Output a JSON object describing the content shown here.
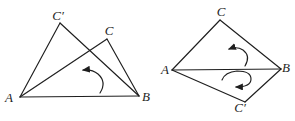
{
  "diagram": {
    "background": "#ffffff",
    "stroke": "#1e1e1e",
    "stroke_width": 1.15,
    "label_size": 13,
    "figures": [
      {
        "name": "left-figure-overlapping-triangles",
        "labels": [
          {
            "id": "C-prime",
            "text": "C′",
            "x": 58,
            "y": 20
          },
          {
            "id": "C",
            "text": "C",
            "x": 109,
            "y": 35
          },
          {
            "id": "A",
            "text": "A",
            "x": 9,
            "y": 102
          },
          {
            "id": "B",
            "text": "B",
            "x": 146,
            "y": 101
          }
        ],
        "edges": [
          {
            "id": "AB",
            "x1": 20,
            "y1": 97,
            "x2": 139,
            "y2": 96
          },
          {
            "id": "A-C-prime",
            "x1": 20,
            "y1": 97,
            "x2": 60,
            "y2": 23
          },
          {
            "id": "C-prime-B",
            "x1": 60,
            "y1": 23,
            "x2": 139,
            "y2": 96
          },
          {
            "id": "AC",
            "x1": 20,
            "y1": 97,
            "x2": 107,
            "y2": 39
          },
          {
            "id": "CB",
            "x1": 107,
            "y1": 39,
            "x2": 139,
            "y2": 96
          }
        ],
        "arrows": [
          {
            "name": "rotation-arrow-counterclockwise",
            "path": "M 100 93 Q 107 82 98 74 Q 92 69 83 70"
          }
        ]
      },
      {
        "name": "right-figure-kite-triangles",
        "labels": [
          {
            "id": "C",
            "text": "C",
            "x": 221,
            "y": 16
          },
          {
            "id": "A",
            "text": "A",
            "x": 165,
            "y": 74
          },
          {
            "id": "B",
            "text": "B",
            "x": 286,
            "y": 72
          },
          {
            "id": "C-prime",
            "text": "C′",
            "x": 240,
            "y": 112
          }
        ],
        "edges": [
          {
            "id": "AC",
            "x1": 172,
            "y1": 70,
            "x2": 220,
            "y2": 20
          },
          {
            "id": "CB",
            "x1": 220,
            "y1": 20,
            "x2": 281,
            "y2": 69
          },
          {
            "id": "AB",
            "x1": 172,
            "y1": 70,
            "x2": 281,
            "y2": 69
          },
          {
            "id": "A-C-prime",
            "x1": 172,
            "y1": 70,
            "x2": 245,
            "y2": 102
          },
          {
            "id": "C-prime-B",
            "x1": 245,
            "y1": 102,
            "x2": 281,
            "y2": 69
          }
        ],
        "arrows": [
          {
            "name": "rotation-arrow-upper",
            "path": "M 245 66 Q 251 56 243 50 Q 237 46 229 49"
          },
          {
            "name": "rotation-arrow-lower",
            "path": "M 222 80 Q 225 72 237 71 Q 251 71 251 79 Q 251 87 236 87"
          }
        ]
      }
    ]
  }
}
